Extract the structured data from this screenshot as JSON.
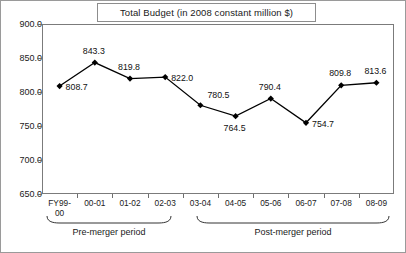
{
  "chart_data": {
    "type": "line",
    "title": "Total Budget (in 2008 constant million $)",
    "xlabel": "",
    "ylabel": "",
    "ylim": [
      650.0,
      900.0
    ],
    "ytick_labels": [
      "900.0",
      "850.0",
      "800.0",
      "750.0",
      "700.0",
      "650.0"
    ],
    "ytick_values": [
      900.0,
      850.0,
      800.0,
      750.0,
      700.0,
      650.0
    ],
    "grid": false,
    "legend": "none",
    "marker": "diamond",
    "line_color": "#000000",
    "marker_color": "#000000",
    "categories": [
      "FY99-\n00",
      "00-01",
      "01-02",
      "02-03",
      "03-04",
      "04-05",
      "05-06",
      "06-07",
      "07-08",
      "08-09"
    ],
    "values": [
      808.7,
      843.3,
      819.8,
      822.0,
      780.5,
      764.5,
      790.4,
      754.7,
      809.8,
      813.6
    ],
    "point_labels": [
      "808.7",
      "843.3",
      "819.8",
      "822.0",
      "780.5",
      "764.5",
      "790.4",
      "754.7",
      "809.8",
      "813.6"
    ],
    "label_positions": [
      "right",
      "above",
      "above",
      "right",
      "above-right",
      "below",
      "above",
      "right",
      "above",
      "above"
    ],
    "annotations": [
      {
        "text": "Pre-merger period",
        "span": [
          "FY99-00",
          "02-03"
        ],
        "type": "brace"
      },
      {
        "text": "Post-merger period",
        "span": [
          "03-04",
          "08-09"
        ],
        "type": "brace"
      }
    ]
  },
  "braces": {
    "pre": "Pre-merger period",
    "post": "Post-merger period"
  }
}
